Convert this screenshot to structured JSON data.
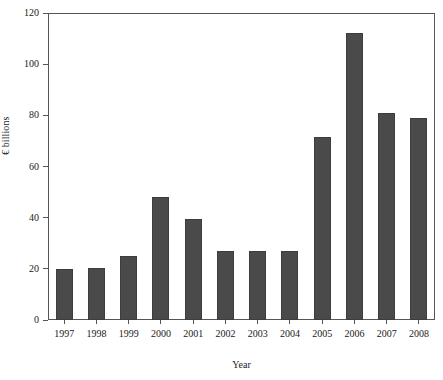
{
  "chart_data": {
    "type": "bar",
    "title": "",
    "subtitle": "",
    "xlabel": "Year",
    "ylabel": "€ billions",
    "categories": [
      "1997",
      "1998",
      "1999",
      "2000",
      "2001",
      "2002",
      "2003",
      "2004",
      "2005",
      "2006",
      "2007",
      "2008"
    ],
    "values": [
      20,
      20.3,
      25,
      48,
      39.5,
      27,
      26.8,
      27,
      71.5,
      112,
      81,
      79
    ],
    "ylim": [
      0,
      120
    ],
    "yticks": [
      0,
      20,
      40,
      60,
      80,
      100,
      120
    ],
    "ytick_labels": [
      "0",
      "20",
      "40",
      "60",
      "80",
      "100",
      "120"
    ],
    "grid": false,
    "legend": false,
    "legend_position": "none",
    "bar_color": "#4a4a4a",
    "bar_edge_color": "#3d3d3d",
    "axis_color": "#555555",
    "background_color": "#ffffff",
    "series": [
      {
        "name": "",
        "values": [
          20,
          20.3,
          25,
          48,
          39.5,
          27,
          26.8,
          27,
          71.5,
          112,
          81,
          79
        ]
      }
    ]
  }
}
